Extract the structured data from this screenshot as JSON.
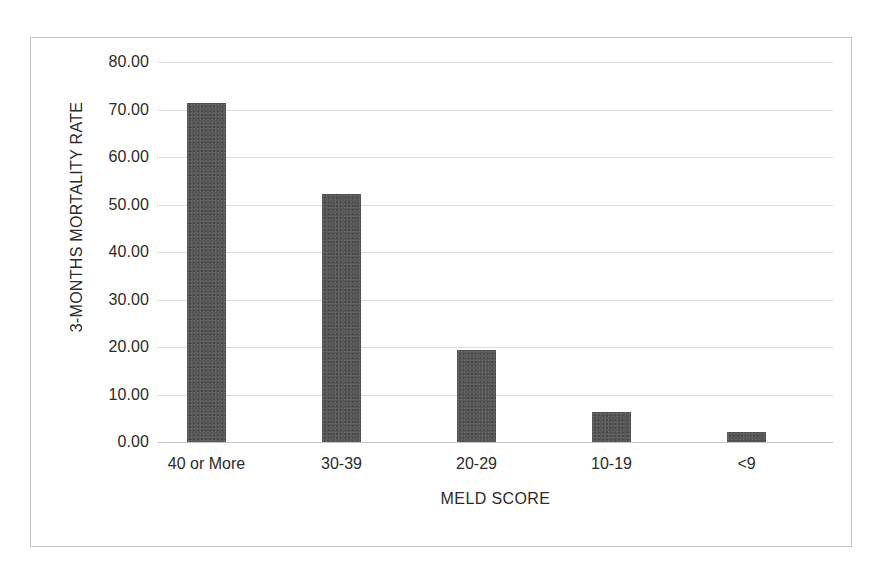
{
  "chart_data": {
    "type": "bar",
    "title": "",
    "xlabel": "MELD SCORE",
    "ylabel": "3-MONTHS MORTALITY RATE",
    "categories": [
      "40 or More",
      "30-39",
      "20-29",
      "10-19",
      "<9"
    ],
    "values": [
      71.4,
      52.2,
      19.3,
      6.4,
      2.1
    ],
    "ylim": [
      0,
      80
    ],
    "yticks": [
      "0.00",
      "10.00",
      "20.00",
      "30.00",
      "40.00",
      "50.00",
      "60.00",
      "70.00",
      "80.00"
    ],
    "ytick_values": [
      0,
      10,
      20,
      30,
      40,
      50,
      60,
      70,
      80
    ],
    "grid": true,
    "legend": "none",
    "bar_color": "#585858",
    "gridline_color": "#dddddd",
    "axis_color": "#c4c4c4",
    "frame_color": "#c9c9c9",
    "background_color": "#ffffff",
    "text_color": "#2b2b2b"
  }
}
